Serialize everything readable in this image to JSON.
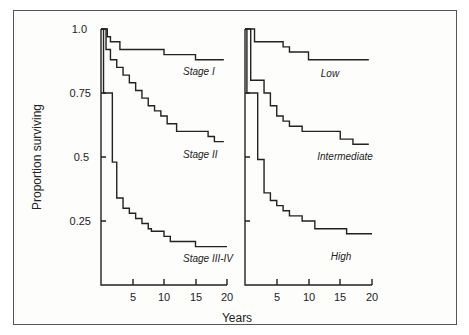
{
  "chart_data": [
    {
      "type": "line",
      "panel": "left",
      "title": "",
      "xlabel": "Years",
      "ylabel": "Proportion surviving",
      "xlim": [
        0,
        20
      ],
      "ylim": [
        0,
        1.0
      ],
      "x_ticks": [
        5,
        10,
        15,
        20
      ],
      "y_ticks": [
        1.0,
        0.75,
        0.5,
        0.25
      ],
      "y_tick_labels": [
        "1.0",
        "0.75",
        "0.5",
        "0.25"
      ],
      "x_tick_labels": [
        "5",
        "10",
        "15",
        "20"
      ],
      "grid": false,
      "series": [
        {
          "name": "Stage I",
          "step": true,
          "x": [
            0,
            1,
            1.5,
            3,
            10,
            15,
            19.5
          ],
          "y": [
            1.0,
            0.97,
            0.95,
            0.92,
            0.9,
            0.88,
            0.88
          ]
        },
        {
          "name": "Stage II",
          "step": true,
          "x": [
            0,
            0.8,
            1.5,
            2.5,
            3.5,
            4.5,
            5.5,
            6.5,
            7.5,
            8.5,
            9.5,
            10.5,
            12,
            17,
            18,
            19.5
          ],
          "y": [
            1.0,
            0.92,
            0.88,
            0.85,
            0.82,
            0.79,
            0.76,
            0.73,
            0.7,
            0.68,
            0.66,
            0.63,
            0.6,
            0.58,
            0.56,
            0.56
          ]
        },
        {
          "name": "Stage III-IV",
          "step": true,
          "x": [
            0,
            0.4,
            1.8,
            2.5,
            3.5,
            4.5,
            5.5,
            6.5,
            7.5,
            8,
            10,
            11,
            15,
            20
          ],
          "y": [
            1.0,
            0.75,
            0.48,
            0.34,
            0.3,
            0.28,
            0.26,
            0.24,
            0.22,
            0.21,
            0.19,
            0.17,
            0.15,
            0.15
          ]
        }
      ],
      "annotations": [
        "Stage I",
        "Stage II",
        "Stage III-IV"
      ]
    },
    {
      "type": "line",
      "panel": "right",
      "title": "",
      "xlabel": "Years",
      "ylabel": "",
      "xlim": [
        0,
        20
      ],
      "ylim": [
        0,
        1.0
      ],
      "x_ticks": [
        5,
        10,
        15,
        20
      ],
      "x_tick_labels": [
        "5",
        "10",
        "15",
        "20"
      ],
      "grid": false,
      "series": [
        {
          "name": "Low",
          "step": true,
          "x": [
            0,
            1.5,
            6,
            7,
            10,
            19.5
          ],
          "y": [
            1.0,
            0.95,
            0.93,
            0.91,
            0.88,
            0.88
          ]
        },
        {
          "name": "Intermediate",
          "step": true,
          "x": [
            0,
            0.9,
            3,
            4,
            5,
            6,
            7,
            9,
            15,
            17,
            19.5
          ],
          "y": [
            1.0,
            0.8,
            0.75,
            0.7,
            0.66,
            0.64,
            0.62,
            0.6,
            0.57,
            0.55,
            0.55
          ]
        },
        {
          "name": "High",
          "step": true,
          "x": [
            0,
            0.3,
            2,
            3,
            4,
            5,
            6,
            7,
            9,
            11,
            16,
            20
          ],
          "y": [
            1.0,
            0.75,
            0.49,
            0.36,
            0.33,
            0.31,
            0.29,
            0.27,
            0.25,
            0.22,
            0.2,
            0.2
          ]
        }
      ],
      "annotations": [
        "Low",
        "Intermediate",
        "High"
      ]
    }
  ],
  "labels": {
    "ylabel": "Proportion surviving",
    "xlabel": "Years",
    "y_ticks": [
      "1.0",
      "0.75",
      "0.5",
      "0.25"
    ],
    "x_ticks": [
      "5",
      "10",
      "15",
      "20"
    ],
    "left_curves": [
      "Stage I",
      "Stage II",
      "Stage III-IV"
    ],
    "right_curves": [
      "Low",
      "Intermediate",
      "High"
    ]
  }
}
